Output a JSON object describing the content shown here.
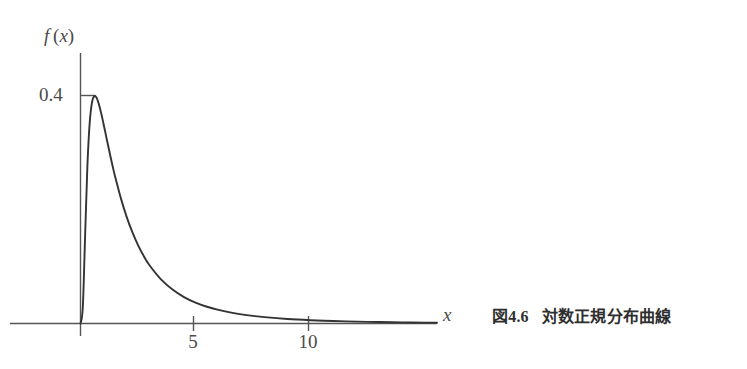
{
  "figure": {
    "caption_prefix": "図",
    "caption_number": "4.6",
    "caption_text": "対数正規分布曲線",
    "curve_color": "#333333",
    "axis_color": "#555555",
    "background_color": "#ffffff"
  },
  "chart_data": {
    "type": "line",
    "title": "",
    "subtitle": "",
    "xlabel": "x",
    "ylabel": "f (x)",
    "xlim": [
      0,
      15.5
    ],
    "ylim": [
      0,
      0.46
    ],
    "grid": false,
    "legend": null,
    "x_ticks": [
      5,
      10
    ],
    "x_tick_labels": [
      "5",
      "10"
    ],
    "y_ticks": [
      0.4
    ],
    "y_tick_labels": [
      "0.4"
    ],
    "annotations": [],
    "series": [
      {
        "name": "lognormal pdf",
        "distribution": "lognormal",
        "mu": 0.0,
        "sigma": 1.0,
        "x": [
          0.0,
          0.1,
          0.2,
          0.3,
          0.4,
          0.5,
          0.6,
          0.7,
          0.8,
          0.9,
          1.0,
          1.1,
          1.2,
          1.3,
          1.4,
          1.5,
          1.75,
          2.0,
          2.25,
          2.5,
          2.75,
          3.0,
          3.5,
          4.0,
          4.5,
          5.0,
          5.5,
          6.0,
          6.5,
          7.0,
          7.5,
          8.0,
          9.0,
          10.0,
          11.0,
          12.0,
          13.0,
          14.0,
          15.0,
          15.5
        ],
        "values": [
          0.0,
          0.0281,
          0.1528,
          0.2765,
          0.3521,
          0.3878,
          0.3989,
          0.396,
          0.3847,
          0.3688,
          0.3505,
          0.3314,
          0.3122,
          0.2934,
          0.2754,
          0.2584,
          0.2204,
          0.188,
          0.1606,
          0.1376,
          0.1183,
          0.1021,
          0.0773,
          0.0595,
          0.0464,
          0.0367,
          0.0294,
          0.0238,
          0.0194,
          0.016,
          0.0133,
          0.0111,
          0.0079,
          0.0058,
          0.0043,
          0.0033,
          0.0025,
          0.002,
          0.0016,
          0.0014
        ]
      }
    ]
  }
}
